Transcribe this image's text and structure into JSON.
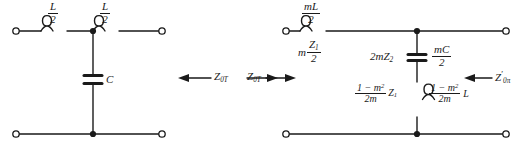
{
  "diagram": {
    "colors": {
      "wire": "#1a1a1a",
      "background": "#ffffff",
      "text": "#1a1a1a"
    },
    "left_circuit": {
      "name": "T-section low-pass prototype",
      "series_inductor_left": {
        "numerator": "L",
        "denominator": "2"
      },
      "series_inductor_right": {
        "numerator": "L",
        "denominator": "2"
      },
      "shunt_capacitor": "C",
      "impedance_label": "Z",
      "impedance_subscript": "0T"
    },
    "center": {
      "left_arrow_label": "Z",
      "left_arrow_subscript": "0T",
      "right_arrow_label": "Z",
      "right_arrow_subscript": "0T"
    },
    "right_circuit": {
      "name": "m-derived half section",
      "series_inductor_top": {
        "numerator": "mL",
        "denominator": "2"
      },
      "series_impedance_below": {
        "prefix": "m",
        "numerator": "Z",
        "numerator_sub": "1",
        "denominator": "2"
      },
      "shunt_capacitor_left_label": {
        "text": "2mZ",
        "sub": "2"
      },
      "shunt_capacitor_right_label": {
        "numerator": "mC",
        "denominator": "2"
      },
      "shunt_inductor_left_label": {
        "numerator": "1 − m",
        "numerator_sup": "2",
        "denominator": "2m",
        "suffix": "Z",
        "suffix_sub": "1"
      },
      "shunt_inductor_right_label": {
        "numerator": "1 − m",
        "numerator_sup": "2",
        "denominator": "2m",
        "suffix": "L"
      },
      "output_impedance": {
        "symbol": "Z",
        "prime": "′",
        "subscript": "0π"
      }
    }
  }
}
